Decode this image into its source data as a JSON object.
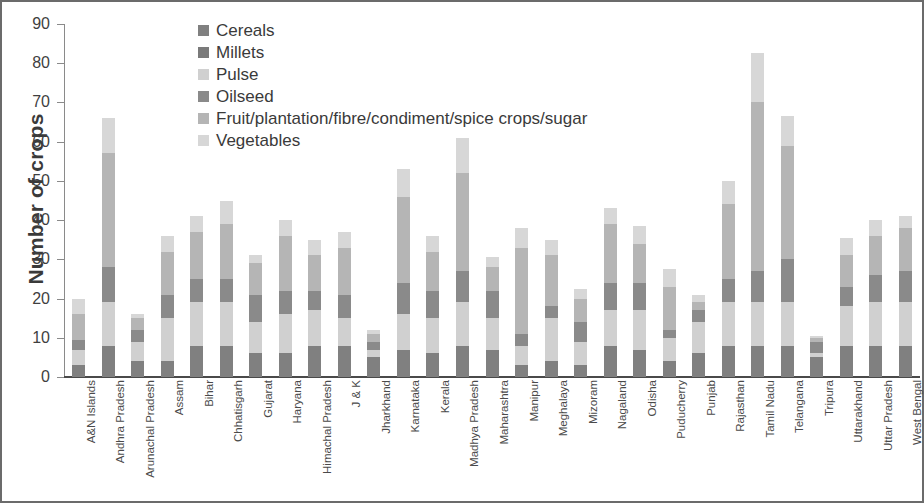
{
  "chart_data": {
    "type": "bar",
    "subtype": "stacked-bar",
    "title": "",
    "xlabel": "",
    "ylabel": "Number of crops",
    "ylim": [
      0,
      90
    ],
    "yticks": [
      0,
      10,
      20,
      30,
      40,
      50,
      60,
      70,
      80,
      90
    ],
    "grid": false,
    "legend_position": "top-center-inside",
    "categories": [
      "A&N Islands",
      "Andhra Pradesh",
      "Arunachal Pradesh",
      "Assam",
      "Bihar",
      "Chhatisgarh",
      "Gujarat",
      "Haryana",
      "Himachal Pradesh",
      "J & K",
      "Jharkhand",
      "Karnataka",
      "Kerala",
      "Madhya Pradesh",
      "Maharashtra",
      "Manipur",
      "Meghalaya",
      "Mizoram",
      "Nagaland",
      "Odisha",
      "Puducherry",
      "Punjab",
      "Rajasthan",
      "Tamil Nadu",
      "Telangana",
      "Tripura",
      "Uttarakhand",
      "Uttar Pradesh",
      "West Bengal"
    ],
    "series": [
      {
        "name": "Cereals",
        "color": "#808080",
        "values": [
          3,
          8,
          4,
          4,
          8,
          8,
          6,
          6,
          8,
          8,
          5,
          7,
          6,
          8,
          7,
          3,
          4,
          3,
          8,
          7,
          4,
          6,
          8,
          8,
          8,
          5,
          8,
          8,
          8
        ]
      },
      {
        "name": "Millets",
        "color": "#7a7a7a",
        "values": [
          0,
          0,
          0,
          0,
          0,
          0,
          0,
          0,
          0,
          0,
          0,
          0,
          0,
          0,
          0,
          0,
          0,
          0,
          0,
          0,
          0,
          0,
          0,
          0,
          0,
          0,
          0,
          0,
          0
        ]
      },
      {
        "name": "Pulse",
        "color": "#d0d0d0",
        "values": [
          4,
          11,
          5,
          11,
          11,
          11,
          8,
          10,
          9,
          7,
          2,
          9,
          9,
          11,
          8,
          5,
          11,
          6,
          9,
          10,
          6,
          8,
          11,
          11,
          11,
          1,
          10,
          11,
          11
        ]
      },
      {
        "name": "Oilseed",
        "color": "#8a8a8a",
        "values": [
          2.5,
          9,
          3,
          6,
          6,
          6,
          7,
          6,
          5,
          6,
          2,
          8,
          7,
          8,
          7,
          3,
          3,
          5,
          7,
          7,
          2,
          3,
          6,
          8,
          11,
          3,
          5,
          7,
          8
        ]
      },
      {
        "name": "Fruit/plantation/fibre/condiment/spice crops/sugar",
        "color": "#b5b5b5",
        "values": [
          6.5,
          29,
          3,
          11,
          12,
          14,
          8,
          14,
          9,
          12,
          2,
          22,
          10,
          25,
          6,
          22,
          13,
          6,
          15,
          10,
          11,
          2,
          19,
          43,
          29,
          1,
          8,
          10,
          11
        ]
      },
      {
        "name": "Vegetables",
        "color": "#d7d7d7",
        "values": [
          4,
          9,
          1,
          4,
          4,
          6,
          2,
          4,
          4,
          4,
          1,
          7,
          4,
          9,
          2.5,
          5,
          4,
          2.5,
          4,
          4.5,
          4.5,
          2,
          6,
          12.5,
          7.5,
          0.5,
          4.5,
          4,
          3
        ]
      }
    ],
    "totals": [
      20,
      66,
      16,
      36,
      41,
      45,
      31,
      40,
      35,
      37,
      12,
      53,
      36,
      61,
      30.5,
      38,
      35,
      22.5,
      43,
      38.5,
      27.5,
      21,
      50,
      82.5,
      66.5,
      10.5,
      35.5,
      40,
      41
    ]
  },
  "legend": {
    "items": [
      {
        "label": "Cereals",
        "color": "#808080"
      },
      {
        "label": "Millets",
        "color": "#7a7a7a"
      },
      {
        "label": "Pulse",
        "color": "#d0d0d0"
      },
      {
        "label": "Oilseed",
        "color": "#8a8a8a"
      },
      {
        "label": "Fruit/plantation/fibre/condiment/spice crops/sugar",
        "color": "#b5b5b5"
      },
      {
        "label": "Vegetables",
        "color": "#d7d7d7"
      }
    ]
  }
}
